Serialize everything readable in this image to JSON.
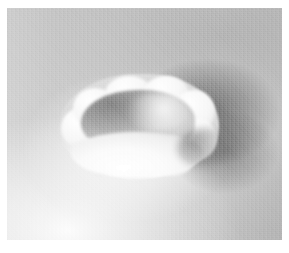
{
  "figure": {
    "domain": "Natural-Image",
    "kind": "grayscale-micrograph",
    "caption": "",
    "plate": {
      "margin_color": "#ffffff",
      "content_left": 7,
      "content_top": 8,
      "content_width": 275,
      "content_height": 232
    },
    "palette": {
      "background_gray": "#c9c9c9",
      "substrate_light": "#d2d2d2",
      "substrate_dark": "#c3c3c3",
      "rim_highlight": "#ffffff",
      "rim_shade": "#e2e2e2",
      "cavity_mid": "#b2b2b2",
      "cavity_dark": "#8a8a8a",
      "shadow_dark": "#3c3c3c",
      "glow_white": "#ffffff"
    },
    "regions": [
      {
        "name": "background-field",
        "label": "Substrate background",
        "description": "Uniform light gray grainy field filling the plate",
        "tone": "#c9c9c9"
      },
      {
        "name": "lower-left-glow",
        "label": "Lower-left bright glow",
        "description": "Broad diffuse white highlight spreading from the lower-left quadrant",
        "tone": "#ffffff"
      },
      {
        "name": "crater-rim",
        "label": "Raised scalloped rim",
        "description": "Bright near-white annular ridge with nine rounded lobes",
        "tone": "#fbfbfb"
      },
      {
        "name": "crater-cavity",
        "label": "Recessed interior cavity",
        "description": "Mid-gray depression, darkest along the upper-left inner wall",
        "tone": "#9b9b9b"
      },
      {
        "name": "right-shadow",
        "label": "Cast shadow",
        "description": "Dark diffuse shadow to the right and lower-right of the structure",
        "tone": "#3c3c3c"
      },
      {
        "name": "grain-texture",
        "label": "Image grain",
        "description": "Fine pixel-scale noise characteristic of electron micrographs",
        "tone": "#c0c0c0"
      }
    ]
  }
}
